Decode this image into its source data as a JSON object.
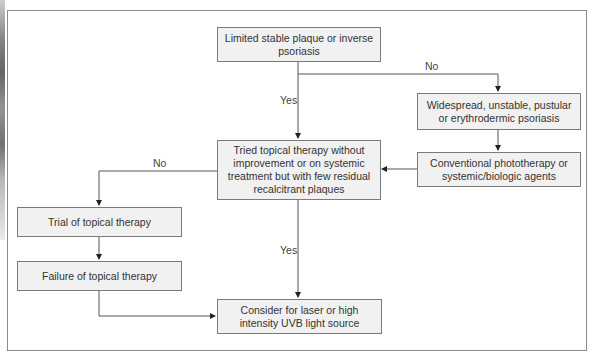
{
  "flowchart": {
    "nodes": {
      "start": "Limited stable plaque or inverse psoriasis",
      "widespread": "Widespread, unstable, pustular or erythrodermic psoriasis",
      "conventional": "Conventional phototherapy or systemic/biologic agents",
      "tried_topical": "Tried topical therapy without improvement or on systemic treatment but with few residual recalcitrant plaques",
      "trial_topical": "Trial of topical therapy",
      "failure_topical": "Failure of topical therapy",
      "consider_laser": "Consider for laser or high intensity UVB light source"
    },
    "edge_labels": {
      "start_yes": "Yes",
      "start_no": "No",
      "tried_no": "No",
      "tried_yes": "Yes"
    },
    "edges": [
      {
        "from": "start",
        "to": "tried_topical",
        "label": "Yes"
      },
      {
        "from": "start",
        "to": "widespread",
        "label": "No"
      },
      {
        "from": "widespread",
        "to": "conventional",
        "label": ""
      },
      {
        "from": "conventional",
        "to": "tried_topical",
        "label": ""
      },
      {
        "from": "tried_topical",
        "to": "trial_topical",
        "label": "No"
      },
      {
        "from": "trial_topical",
        "to": "failure_topical",
        "label": ""
      },
      {
        "from": "tried_topical",
        "to": "consider_laser",
        "label": "Yes"
      },
      {
        "from": "failure_topical",
        "to": "consider_laser",
        "label": ""
      }
    ]
  }
}
